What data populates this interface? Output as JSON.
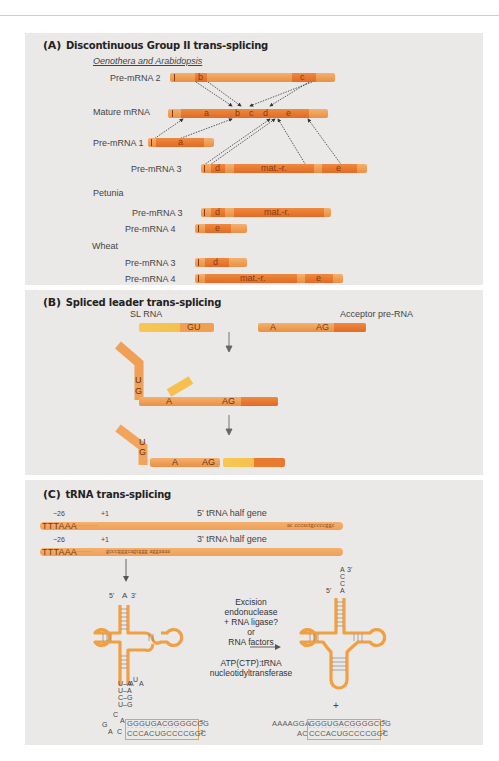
{
  "panelA": {
    "letter": "(A)",
    "title": "Discontinuous Group II trans-splicing",
    "group1_label": "Oenothera and Arabidopsis",
    "rows": [
      {
        "label": "Pre-mRNA 2",
        "segments": [
          "b",
          "c"
        ]
      },
      {
        "label": "Mature mRNA",
        "segments": [
          "a",
          "b",
          "c",
          "d",
          "e"
        ]
      },
      {
        "label": "Pre-mRNA 1",
        "segments": [
          "a"
        ]
      },
      {
        "label": "Pre-mRNA 3",
        "segments": [
          "d",
          "mat.-r.",
          "e"
        ]
      }
    ],
    "group2_label": "Petunia",
    "petunia_rows": [
      {
        "label": "Pre-mRNA 3",
        "segments": [
          "d",
          "mat.-r."
        ]
      },
      {
        "label": "Pre-mRNA 4",
        "segments": [
          "e"
        ]
      }
    ],
    "group3_label": "Wheat",
    "wheat_rows": [
      {
        "label": "Pre-mRNA 3",
        "segments": [
          "d"
        ]
      },
      {
        "label": "Pre-mRNA 4",
        "segments": [
          "mat.-r.",
          "e"
        ]
      }
    ]
  },
  "panelB": {
    "letter": "(B)",
    "title": "Spliced leader trans-splicing",
    "sl_rna_label": "SL RNA",
    "acceptor_label": "Acceptor pre-RNA",
    "gu": "GU",
    "a": "A",
    "ag": "AG",
    "u": "U",
    "g": "G"
  },
  "panelC": {
    "letter": "(C)",
    "title": "tRNA trans-splicing",
    "pos_minus26": "−26",
    "pos_plus1": "+1",
    "half5_label": "5' tRNA half gene",
    "half3_label": "3' tRNA half gene",
    "tttaaa": "TTTAAA",
    "seq5_end": "ac cccactgccccggc",
    "seq3_start": "gcccgggcagtggg aggaaaa",
    "enzyme_text": [
      "Excision",
      "endonuclease",
      "+ RNA ligase?",
      "or",
      "RNA factors"
    ],
    "ntase_text": [
      "ATP(CTP):tRNA",
      "nucleotidyltransferase"
    ],
    "prime5": "5'",
    "prime3": "3'",
    "acceptor_A": "A",
    "cca": [
      "A",
      "C",
      "C",
      "A"
    ],
    "plus": "+",
    "left_stem_pairs": [
      "U–A",
      "U–A",
      "C–G",
      "U–G"
    ],
    "loop_letters": {
      "UA": "U A",
      "AA": "AA",
      "C": "C",
      "G": "G",
      "A1": "A",
      "A2": "A",
      "C2": "C"
    },
    "duplex_top": "GGGUGACGGGGCCG",
    "duplex_bottom": "CCCACUGCCCCGGC",
    "right_prefix_top": "AAAAGGA",
    "right_prefix_bottom": "AC"
  },
  "colors": {
    "panel_bg": "#ebe9e8",
    "exon_light": "#f2a55a",
    "exon_dark": "#e87a30",
    "sl_yellow": "#f7c850",
    "trna_outline": "#f0a040"
  }
}
